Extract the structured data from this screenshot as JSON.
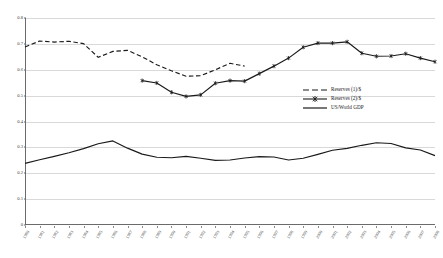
{
  "chart_data": {
    "type": "line",
    "title": "",
    "subtitle": "",
    "xlabel": "",
    "ylabel": "",
    "ylim": [
      0,
      0.8
    ],
    "ytick_labels": [
      "0",
      "0.1",
      "0.2",
      "0.3",
      "0.4",
      "0.5",
      "0.6",
      "0.7",
      "0.8"
    ],
    "ytick_values": [
      0,
      0.1,
      0.2,
      0.3,
      0.4,
      0.5,
      0.6,
      0.7,
      0.8
    ],
    "grid": "horizontal",
    "legend_position": "center-right",
    "categories": [
      "1980",
      "1981",
      "1982",
      "1983",
      "1984",
      "1985",
      "1986",
      "1987",
      "1988",
      "1989",
      "1990",
      "1991",
      "1992",
      "1993",
      "1994",
      "1995",
      "1996",
      "1997",
      "1998",
      "1999",
      "2000",
      "2001",
      "2002",
      "2003",
      "2004",
      "2005",
      "2006",
      "2007",
      "2008"
    ],
    "series": [
      {
        "name": "Reserves (1)/$",
        "style": "dashed",
        "marker": "none",
        "color": "#1a1a1a",
        "values": [
          0.688,
          0.711,
          0.707,
          0.71,
          0.701,
          0.648,
          0.671,
          0.675,
          0.65,
          0.619,
          0.596,
          0.575,
          0.577,
          0.6,
          0.625,
          0.614,
          null,
          null,
          null,
          null,
          null,
          null,
          null,
          null,
          null,
          null,
          null,
          null,
          null
        ]
      },
      {
        "name": "Reserves (2)/$",
        "style": "solid",
        "marker": "star",
        "color": "#1a1a1a",
        "values": [
          null,
          null,
          null,
          null,
          null,
          null,
          null,
          null,
          0.558,
          0.549,
          0.513,
          0.497,
          0.503,
          0.548,
          0.558,
          0.556,
          0.585,
          0.614,
          0.645,
          0.687,
          0.703,
          0.703,
          0.708,
          0.664,
          0.652,
          0.653,
          0.662,
          0.645,
          0.631
        ]
      },
      {
        "name": "US/World GDP",
        "style": "solid",
        "marker": "none",
        "color": "#1a1a1a",
        "values": [
          0.238,
          0.252,
          0.265,
          0.279,
          0.295,
          0.314,
          0.325,
          0.297,
          0.274,
          0.262,
          0.26,
          0.265,
          0.258,
          0.25,
          0.251,
          0.259,
          0.264,
          0.263,
          0.251,
          0.258,
          0.273,
          0.289,
          0.296,
          0.308,
          0.318,
          0.315,
          0.298,
          0.29,
          0.268
        ]
      }
    ]
  },
  "legend": {
    "items": [
      {
        "label": "Reserves (1)/$"
      },
      {
        "label": "Reserves (2)/$"
      },
      {
        "label": "US/World GDP"
      }
    ]
  }
}
